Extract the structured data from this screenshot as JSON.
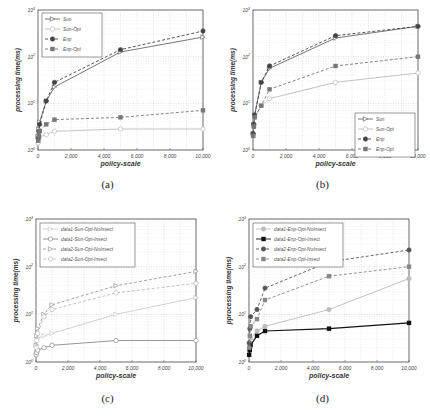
{
  "figure": {
    "panels": [
      {
        "id": "a",
        "caption": "(a)"
      },
      {
        "id": "b",
        "caption": "(b)"
      },
      {
        "id": "c",
        "caption": "(c)"
      },
      {
        "id": "d",
        "caption": "(d)"
      }
    ]
  },
  "chart_data": [
    {
      "panel": "a",
      "type": "line",
      "title": "",
      "caption": "(a)",
      "xlabel": "policy-scale",
      "ylabel": "processing time(ms)",
      "xscale": "linear",
      "yscale": "log",
      "xlim": [
        0,
        10000
      ],
      "ylim_decades": [
        0,
        3
      ],
      "xticks": [
        "0",
        "2,000",
        "4,000",
        "6,000",
        "8,000",
        "10,000"
      ],
      "yticks": [
        "10^0",
        "10^1",
        "10^2",
        "10^3"
      ],
      "grid": true,
      "legend_position": "upper-left",
      "x": [
        10,
        50,
        100,
        500,
        1000,
        5000,
        10000
      ],
      "series": [
        {
          "name": "Sun",
          "style": "solid",
          "marker": "triangle-right-open",
          "color": "#666666",
          "log10_values": [
            0.3,
            0.45,
            0.6,
            1.05,
            1.35,
            2.1,
            2.42
          ]
        },
        {
          "name": "Sun-Opt",
          "style": "solid",
          "marker": "circle-open",
          "color": "#bbbbbb",
          "log10_values": [
            0.15,
            0.22,
            0.28,
            0.33,
            0.4,
            0.45,
            0.45
          ]
        },
        {
          "name": "Enp",
          "style": "dashed",
          "marker": "circle-filled",
          "color": "#444444",
          "log10_values": [
            0.25,
            0.4,
            0.55,
            1.05,
            1.45,
            2.15,
            2.55
          ]
        },
        {
          "name": "Enp-Opt",
          "style": "dashed",
          "marker": "square-filled",
          "color": "#777777",
          "log10_values": [
            0.2,
            0.3,
            0.4,
            0.55,
            0.65,
            0.7,
            0.85
          ]
        }
      ]
    },
    {
      "panel": "b",
      "type": "line",
      "title": "",
      "caption": "(b)",
      "xlabel": "policy-scale",
      "ylabel": "processing time(ms)",
      "xscale": "linear",
      "yscale": "log",
      "xlim": [
        0,
        10000
      ],
      "ylim_decades": [
        0,
        3
      ],
      "xticks": [
        "0",
        "2,000",
        "4,000",
        "6,000",
        "8,000",
        "10,000"
      ],
      "yticks": [
        "10^0",
        "10^1",
        "10^2",
        "10^3"
      ],
      "grid": true,
      "legend_position": "lower-right",
      "x": [
        10,
        50,
        100,
        500,
        1000,
        5000,
        10000
      ],
      "series": [
        {
          "name": "Sun",
          "style": "solid",
          "marker": "triangle-right-open",
          "color": "#666666",
          "log10_values": [
            0.35,
            0.55,
            0.75,
            1.45,
            1.75,
            2.4,
            2.65
          ]
        },
        {
          "name": "Sun-Opt",
          "style": "solid",
          "marker": "circle-open",
          "color": "#bbbbbb",
          "log10_values": [
            0.3,
            0.5,
            0.7,
            0.95,
            1.1,
            1.45,
            1.65
          ]
        },
        {
          "name": "Enp",
          "style": "dashed",
          "marker": "circle-filled",
          "color": "#444444",
          "log10_values": [
            0.35,
            0.55,
            0.75,
            1.45,
            1.8,
            2.45,
            2.65
          ]
        },
        {
          "name": "Enp-Opt",
          "style": "dashed",
          "marker": "square-filled",
          "color": "#777777",
          "log10_values": [
            0.3,
            0.5,
            0.7,
            0.95,
            1.3,
            1.8,
            2.0
          ]
        }
      ]
    },
    {
      "panel": "c",
      "type": "line",
      "title": "",
      "caption": "(c)",
      "xlabel": "policy-scale",
      "ylabel": "processing time(ms)",
      "xscale": "linear",
      "yscale": "log",
      "xlim": [
        0,
        10000
      ],
      "ylim_decades": [
        0,
        3
      ],
      "xticks": [
        "0",
        "2,000",
        "4,000",
        "6,000",
        "8,000",
        "10,000"
      ],
      "yticks": [
        "10^0",
        "10^1",
        "10^2",
        "10^3"
      ],
      "grid": true,
      "legend_position": "upper-left",
      "x": [
        10,
        50,
        100,
        500,
        1000,
        5000,
        10000
      ],
      "series": [
        {
          "name": "data1-Sun-Opt-NoInsect",
          "style": "solid",
          "marker": "triangle-right-open",
          "color": "#cccccc",
          "log10_values": [
            0.2,
            0.35,
            0.5,
            0.55,
            0.6,
            1.0,
            1.35
          ]
        },
        {
          "name": "data1-Sun-Opt-Insect",
          "style": "solid",
          "marker": "circle-open",
          "color": "#888888",
          "log10_values": [
            0.15,
            0.2,
            0.25,
            0.3,
            0.35,
            0.45,
            0.45
          ]
        },
        {
          "name": "data2-Sun-Opt-NoInsect",
          "style": "dashed",
          "marker": "triangle-right-open",
          "color": "#999999",
          "log10_values": [
            0.35,
            0.55,
            0.7,
            1.0,
            1.2,
            1.6,
            1.9
          ]
        },
        {
          "name": "data2-Sun-Opt-Insect",
          "style": "dashed",
          "marker": "circle-open",
          "color": "#bbbbbb",
          "log10_values": [
            0.3,
            0.45,
            0.6,
            0.95,
            1.1,
            1.45,
            1.65
          ]
        }
      ]
    },
    {
      "panel": "d",
      "type": "line",
      "title": "",
      "caption": "(d)",
      "xlabel": "policy-scale",
      "ylabel": "pprocessing time(ms)",
      "xscale": "linear",
      "yscale": "log",
      "xlim": [
        0,
        10000
      ],
      "ylim_decades": [
        0,
        3
      ],
      "xticks": [
        "0",
        "2,000",
        "4,000",
        "6,000",
        "8,000",
        "10,000"
      ],
      "yticks": [
        "10^0",
        "10^1",
        "10^2",
        "10^3"
      ],
      "grid": true,
      "legend_position": "upper-left",
      "x": [
        10,
        50,
        100,
        500,
        1000,
        5000,
        10000
      ],
      "series": [
        {
          "name": "data1-Enp-Opt-NoInsect",
          "style": "solid",
          "marker": "circle-filled",
          "color": "#bbbbbb",
          "log10_values": [
            0.25,
            0.4,
            0.5,
            0.65,
            0.75,
            1.1,
            1.75
          ]
        },
        {
          "name": "data1-Enp-Opt-Insect",
          "style": "solid",
          "marker": "square-filled",
          "color": "#111111",
          "log10_values": [
            0.15,
            0.25,
            0.35,
            0.55,
            0.65,
            0.7,
            0.82
          ]
        },
        {
          "name": "data2-Enp-Opt-NoInsect",
          "style": "dashed",
          "marker": "circle-filled",
          "color": "#555555",
          "log10_values": [
            0.4,
            0.7,
            0.95,
            1.1,
            1.55,
            2.1,
            2.35
          ]
        },
        {
          "name": "data2-Enp-Opt-Insect",
          "style": "dashed",
          "marker": "square-filled",
          "color": "#888888",
          "log10_values": [
            0.3,
            0.55,
            0.75,
            0.9,
            1.3,
            1.8,
            2.0
          ]
        }
      ]
    }
  ]
}
